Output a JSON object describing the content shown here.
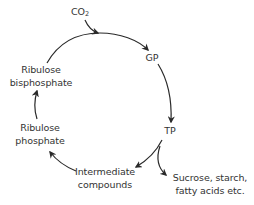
{
  "diagram": {
    "type": "cycle",
    "nodes": {
      "co2": {
        "label": "CO",
        "subscript": "2"
      },
      "gp": {
        "label": "GP"
      },
      "tp": {
        "label": "TP"
      },
      "intermediate": {
        "line1": "Intermediate",
        "line2": "compounds"
      },
      "products": {
        "line1": "Sucrose, starch,",
        "line2": "fatty acids etc."
      },
      "ribulose_phosphate": {
        "line1": "Ribulose",
        "line2": "phosphate"
      },
      "ribulose_bisphosphate": {
        "line1": "Ribulose",
        "line2": "bisphosphate"
      }
    },
    "edges": [
      {
        "from": "co2",
        "to": "cycle-arc"
      },
      {
        "from": "ribulose_bisphosphate",
        "to": "gp"
      },
      {
        "from": "gp",
        "to": "tp"
      },
      {
        "from": "tp",
        "to": "intermediate"
      },
      {
        "from": "tp",
        "to": "products"
      },
      {
        "from": "intermediate",
        "to": "ribulose_phosphate"
      },
      {
        "from": "ribulose_phosphate",
        "to": "ribulose_bisphosphate"
      }
    ],
    "colors": {
      "stroke": "#2a2a2a",
      "text": "#333333",
      "background": "#ffffff"
    }
  }
}
